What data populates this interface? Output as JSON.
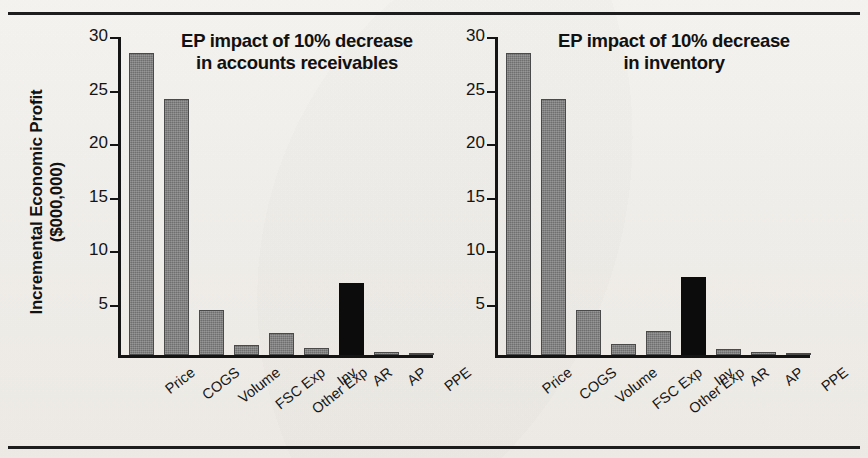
{
  "figure": {
    "background_color": "#f3f1ed",
    "rule_color": "#1d1d1d",
    "bar_gray": "#6f6f6f",
    "bar_black": "#0c0c0c",
    "axis_color": "#141414"
  },
  "axis": {
    "ylabel_line1": "Incremental Economic Profit",
    "ylabel_line2": "($000,000)",
    "ticks": [
      "30",
      "25",
      "20",
      "15",
      "10",
      "5"
    ]
  },
  "chart_data": [
    {
      "type": "bar",
      "id": "left",
      "title": "EP impact of 10% decrease in accounts receivables",
      "title_line1": "EP impact of 10% decrease",
      "title_line2": "in accounts receivables",
      "xlabel": "",
      "ylabel": "Incremental Economic Profit ($000,000)",
      "ylim": [
        0,
        30
      ],
      "yticks": [
        5,
        10,
        15,
        20,
        25,
        30
      ],
      "grid": false,
      "legend": "none",
      "highlight_category": "AR",
      "highlight_color": "#0c0c0c",
      "default_color": "#6f6f6f",
      "categories": [
        "Price",
        "COGS",
        "Volume",
        "FSC Exp",
        "Other Exp",
        "Inv",
        "AR",
        "AP",
        "PPE"
      ],
      "values": [
        28.2,
        23.9,
        4.2,
        0.9,
        2.1,
        0.7,
        6.7,
        0.3,
        0.1
      ]
    },
    {
      "type": "bar",
      "id": "right",
      "title": "EP impact of 10% decrease in inventory",
      "title_line1": "EP impact of 10% decrease",
      "title_line2": "in inventory",
      "xlabel": "",
      "ylabel": "Incremental Economic Profit ($000,000)",
      "ylim": [
        0,
        30
      ],
      "yticks": [
        5,
        10,
        15,
        20,
        25,
        30
      ],
      "grid": false,
      "legend": "none",
      "highlight_category": "Inv",
      "highlight_color": "#0c0c0c",
      "default_color": "#6f6f6f",
      "categories": [
        "Price",
        "COGS",
        "Volume",
        "FSC Exp",
        "Other Exp",
        "Inv",
        "AR",
        "AP",
        "PPE"
      ],
      "values": [
        28.2,
        23.9,
        4.2,
        1.0,
        2.2,
        7.3,
        0.6,
        0.3,
        0.1
      ]
    }
  ]
}
